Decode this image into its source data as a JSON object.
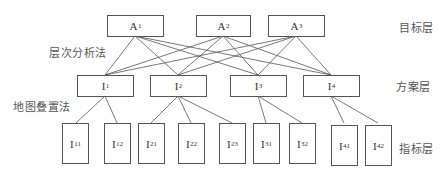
{
  "diagram": {
    "method_labels": {
      "ahp": "层次分析法",
      "overlay": "地图叠置法"
    },
    "layer_labels": {
      "goal": "目标层",
      "scheme": "方案层",
      "indicator": "指标层"
    },
    "goal_layer": [
      {
        "base": "A",
        "sub": "1"
      },
      {
        "base": "A",
        "sub": "2"
      },
      {
        "base": "A",
        "sub": "3"
      }
    ],
    "scheme_layer": [
      {
        "base": "I",
        "sub": "1"
      },
      {
        "base": "I",
        "sub": "2"
      },
      {
        "base": "I",
        "sub": "3"
      },
      {
        "base": "I",
        "sub": "4"
      }
    ],
    "indicator_layer": [
      {
        "base": "I",
        "sub": "11",
        "parent": "I1"
      },
      {
        "base": "I",
        "sub": "12",
        "parent": "I1"
      },
      {
        "base": "I",
        "sub": "21",
        "parent": "I2"
      },
      {
        "base": "I",
        "sub": "22",
        "parent": "I2"
      },
      {
        "base": "I",
        "sub": "23",
        "parent": "I2"
      },
      {
        "base": "I",
        "sub": "31",
        "parent": "I3"
      },
      {
        "base": "I",
        "sub": "32",
        "parent": "I3"
      },
      {
        "base": "I",
        "sub": "41",
        "parent": "I4"
      },
      {
        "base": "I",
        "sub": "42",
        "parent": "I4"
      }
    ],
    "connections": "Each goal node A1–A3 connects to every scheme node I1–I4; each scheme node connects to its own indicator nodes.",
    "colors": {
      "line": "#555555",
      "text": "#333333",
      "background": "#ffffff"
    }
  }
}
